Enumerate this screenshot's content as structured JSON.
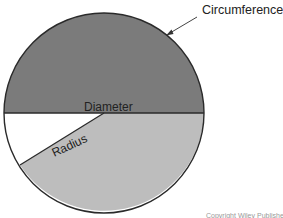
{
  "diagram": {
    "labels": {
      "circumference": "Circumference",
      "diameter": "Diameter",
      "radius": "Radius"
    },
    "credit": "Copyright Wiley Publisher"
  },
  "geometry": {
    "center": [
      104,
      113
    ],
    "radius": 100,
    "radius_line_end": [
      20,
      165
    ],
    "arrow_from": [
      197,
      17
    ],
    "arrow_to": [
      167,
      35
    ]
  },
  "colors": {
    "upper_half": "#7b7b7b",
    "lower_sector": "#bdbdbd",
    "wedge": "#ffffff",
    "outline": "#2a2a2a",
    "text": "#222222"
  }
}
